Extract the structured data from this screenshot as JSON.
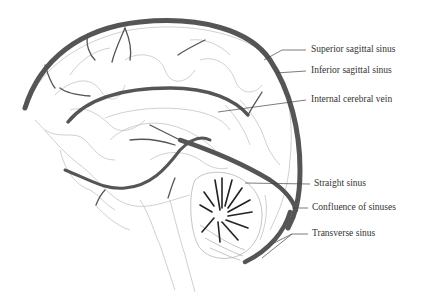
{
  "figure": {
    "type": "anatomical-illustration"
  },
  "colors": {
    "sinus": "#555555",
    "outline": "#bbbbbb",
    "leader": "#444444",
    "text": "#333333",
    "background": "#ffffff"
  },
  "labels": [
    {
      "id": "superior-sagittal-sinus",
      "text": "Superior sagittal sinus",
      "x": 311,
      "y": 46
    },
    {
      "id": "inferior-sagittal-sinus",
      "text": "Inferior sagittal sinus",
      "x": 311,
      "y": 67
    },
    {
      "id": "internal-cerebral-vein",
      "text": "Internal cerebral vein",
      "x": 311,
      "y": 96
    },
    {
      "id": "straight-sinus",
      "text": "Straight sinus",
      "x": 314,
      "y": 181
    },
    {
      "id": "confluence-of-sinuses",
      "text": "Confluence of sinuses",
      "x": 312,
      "y": 205
    },
    {
      "id": "transverse-sinus",
      "text": "Transverse sinus",
      "x": 312,
      "y": 230
    }
  ]
}
